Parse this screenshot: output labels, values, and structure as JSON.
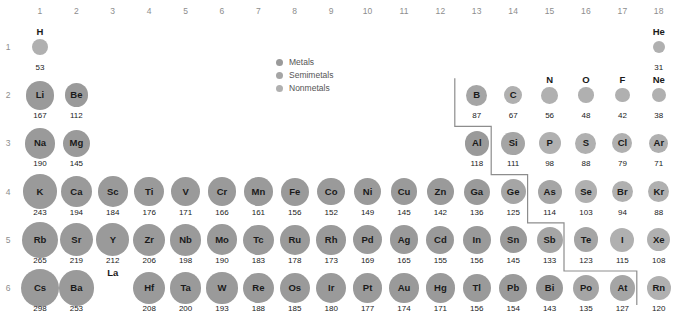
{
  "colors": {
    "metal": "#9a9a9a",
    "semimetal": "#a5a5a5",
    "nonmetal": "#b0b0b0",
    "text": "#1a1a1a",
    "muted": "#8d8d8d",
    "stair": "#8d8d8d"
  },
  "legend": {
    "items": [
      {
        "label": "Metals",
        "color": "#9a9a9a",
        "key": "metal"
      },
      {
        "label": "Semimetals",
        "color": "#a5a5a5",
        "key": "semimetal"
      },
      {
        "label": "Nonmetals",
        "color": "#b0b0b0",
        "key": "nonmetal"
      }
    ]
  },
  "axes": {
    "group_headers": [
      "1",
      "2",
      "3",
      "4",
      "5",
      "6",
      "7",
      "8",
      "9",
      "10",
      "11",
      "12",
      "13",
      "14",
      "15",
      "16",
      "17",
      "18"
    ],
    "period_labels": [
      "1",
      "2",
      "3",
      "4",
      "5",
      "6"
    ]
  },
  "chart_data": {
    "type": "scatter",
    "xlabel": "Group",
    "ylabel": "Period",
    "value_unit": "pm",
    "value_name": "Atomic radius",
    "encoding": "bubble area encodes atomic radius; grayscale fill encodes element class",
    "categories": [
      "1",
      "2",
      "3",
      "4",
      "5",
      "6",
      "7",
      "8",
      "9",
      "10",
      "11",
      "12",
      "13",
      "14",
      "15",
      "16",
      "17",
      "18"
    ],
    "legend_position": "top-center",
    "grid": false,
    "elements": [
      {
        "symbol": "H",
        "group": 1,
        "period": 1,
        "value": 53,
        "class": "nonmetal"
      },
      {
        "symbol": "He",
        "group": 18,
        "period": 1,
        "value": 31,
        "class": "nonmetal"
      },
      {
        "symbol": "Li",
        "group": 1,
        "period": 2,
        "value": 167,
        "class": "metal"
      },
      {
        "symbol": "Be",
        "group": 2,
        "period": 2,
        "value": 112,
        "class": "metal"
      },
      {
        "symbol": "B",
        "group": 13,
        "period": 2,
        "value": 87,
        "class": "semimetal"
      },
      {
        "symbol": "C",
        "group": 14,
        "period": 2,
        "value": 67,
        "class": "nonmetal"
      },
      {
        "symbol": "N",
        "group": 15,
        "period": 2,
        "value": 56,
        "class": "nonmetal"
      },
      {
        "symbol": "O",
        "group": 16,
        "period": 2,
        "value": 48,
        "class": "nonmetal"
      },
      {
        "symbol": "F",
        "group": 17,
        "period": 2,
        "value": 42,
        "class": "nonmetal"
      },
      {
        "symbol": "Ne",
        "group": 18,
        "period": 2,
        "value": 38,
        "class": "nonmetal"
      },
      {
        "symbol": "Na",
        "group": 1,
        "period": 3,
        "value": 190,
        "class": "metal"
      },
      {
        "symbol": "Mg",
        "group": 2,
        "period": 3,
        "value": 145,
        "class": "metal"
      },
      {
        "symbol": "Al",
        "group": 13,
        "period": 3,
        "value": 118,
        "class": "metal"
      },
      {
        "symbol": "Si",
        "group": 14,
        "period": 3,
        "value": 111,
        "class": "semimetal"
      },
      {
        "symbol": "P",
        "group": 15,
        "period": 3,
        "value": 98,
        "class": "nonmetal"
      },
      {
        "symbol": "S",
        "group": 16,
        "period": 3,
        "value": 88,
        "class": "nonmetal"
      },
      {
        "symbol": "Cl",
        "group": 17,
        "period": 3,
        "value": 79,
        "class": "nonmetal"
      },
      {
        "symbol": "Ar",
        "group": 18,
        "period": 3,
        "value": 71,
        "class": "nonmetal"
      },
      {
        "symbol": "K",
        "group": 1,
        "period": 4,
        "value": 243,
        "class": "metal"
      },
      {
        "symbol": "Ca",
        "group": 2,
        "period": 4,
        "value": 194,
        "class": "metal"
      },
      {
        "symbol": "Sc",
        "group": 3,
        "period": 4,
        "value": 184,
        "class": "metal"
      },
      {
        "symbol": "Ti",
        "group": 4,
        "period": 4,
        "value": 176,
        "class": "metal"
      },
      {
        "symbol": "V",
        "group": 5,
        "period": 4,
        "value": 171,
        "class": "metal"
      },
      {
        "symbol": "Cr",
        "group": 6,
        "period": 4,
        "value": 166,
        "class": "metal"
      },
      {
        "symbol": "Mn",
        "group": 7,
        "period": 4,
        "value": 161,
        "class": "metal"
      },
      {
        "symbol": "Fe",
        "group": 8,
        "period": 4,
        "value": 156,
        "class": "metal"
      },
      {
        "symbol": "Co",
        "group": 9,
        "period": 4,
        "value": 152,
        "class": "metal"
      },
      {
        "symbol": "Ni",
        "group": 10,
        "period": 4,
        "value": 149,
        "class": "metal"
      },
      {
        "symbol": "Cu",
        "group": 11,
        "period": 4,
        "value": 145,
        "class": "metal"
      },
      {
        "symbol": "Zn",
        "group": 12,
        "period": 4,
        "value": 142,
        "class": "metal"
      },
      {
        "symbol": "Ga",
        "group": 13,
        "period": 4,
        "value": 136,
        "class": "metal"
      },
      {
        "symbol": "Ge",
        "group": 14,
        "period": 4,
        "value": 125,
        "class": "semimetal"
      },
      {
        "symbol": "As",
        "group": 15,
        "period": 4,
        "value": 114,
        "class": "semimetal"
      },
      {
        "symbol": "Se",
        "group": 16,
        "period": 4,
        "value": 103,
        "class": "nonmetal"
      },
      {
        "symbol": "Br",
        "group": 17,
        "period": 4,
        "value": 94,
        "class": "nonmetal"
      },
      {
        "symbol": "Kr",
        "group": 18,
        "period": 4,
        "value": 88,
        "class": "nonmetal"
      },
      {
        "symbol": "Rb",
        "group": 1,
        "period": 5,
        "value": 265,
        "class": "metal"
      },
      {
        "symbol": "Sr",
        "group": 2,
        "period": 5,
        "value": 219,
        "class": "metal"
      },
      {
        "symbol": "Y",
        "group": 3,
        "period": 5,
        "value": 212,
        "class": "metal"
      },
      {
        "symbol": "Zr",
        "group": 4,
        "period": 5,
        "value": 206,
        "class": "metal"
      },
      {
        "symbol": "Nb",
        "group": 5,
        "period": 5,
        "value": 198,
        "class": "metal"
      },
      {
        "symbol": "Mo",
        "group": 6,
        "period": 5,
        "value": 190,
        "class": "metal"
      },
      {
        "symbol": "Tc",
        "group": 7,
        "period": 5,
        "value": 183,
        "class": "metal"
      },
      {
        "symbol": "Ru",
        "group": 8,
        "period": 5,
        "value": 178,
        "class": "metal"
      },
      {
        "symbol": "Rh",
        "group": 9,
        "period": 5,
        "value": 173,
        "class": "metal"
      },
      {
        "symbol": "Pd",
        "group": 10,
        "period": 5,
        "value": 169,
        "class": "metal"
      },
      {
        "symbol": "Ag",
        "group": 11,
        "period": 5,
        "value": 165,
        "class": "metal"
      },
      {
        "symbol": "Cd",
        "group": 12,
        "period": 5,
        "value": 155,
        "class": "metal"
      },
      {
        "symbol": "In",
        "group": 13,
        "period": 5,
        "value": 156,
        "class": "metal"
      },
      {
        "symbol": "Sn",
        "group": 14,
        "period": 5,
        "value": 145,
        "class": "metal"
      },
      {
        "symbol": "Sb",
        "group": 15,
        "period": 5,
        "value": 133,
        "class": "semimetal"
      },
      {
        "symbol": "Te",
        "group": 16,
        "period": 5,
        "value": 123,
        "class": "semimetal"
      },
      {
        "symbol": "I",
        "group": 17,
        "period": 5,
        "value": 115,
        "class": "nonmetal"
      },
      {
        "symbol": "Xe",
        "group": 18,
        "period": 5,
        "value": 108,
        "class": "nonmetal"
      },
      {
        "symbol": "Cs",
        "group": 1,
        "period": 6,
        "value": 298,
        "class": "metal"
      },
      {
        "symbol": "Ba",
        "group": 2,
        "period": 6,
        "value": 253,
        "class": "metal"
      },
      {
        "symbol": "La",
        "group": 3,
        "period": 6,
        "value": null,
        "class": "metal"
      },
      {
        "symbol": "Hf",
        "group": 4,
        "period": 6,
        "value": 208,
        "class": "metal"
      },
      {
        "symbol": "Ta",
        "group": 5,
        "period": 6,
        "value": 200,
        "class": "metal"
      },
      {
        "symbol": "W",
        "group": 6,
        "period": 6,
        "value": 193,
        "class": "metal"
      },
      {
        "symbol": "Re",
        "group": 7,
        "period": 6,
        "value": 188,
        "class": "metal"
      },
      {
        "symbol": "Os",
        "group": 8,
        "period": 6,
        "value": 185,
        "class": "metal"
      },
      {
        "symbol": "Ir",
        "group": 9,
        "period": 6,
        "value": 180,
        "class": "metal"
      },
      {
        "symbol": "Pt",
        "group": 10,
        "period": 6,
        "value": 177,
        "class": "metal"
      },
      {
        "symbol": "Au",
        "group": 11,
        "period": 6,
        "value": 174,
        "class": "metal"
      },
      {
        "symbol": "Hg",
        "group": 12,
        "period": 6,
        "value": 171,
        "class": "metal"
      },
      {
        "symbol": "Tl",
        "group": 13,
        "period": 6,
        "value": 156,
        "class": "metal"
      },
      {
        "symbol": "Pb",
        "group": 14,
        "period": 6,
        "value": 154,
        "class": "metal"
      },
      {
        "symbol": "Bi",
        "group": 15,
        "period": 6,
        "value": 143,
        "class": "metal"
      },
      {
        "symbol": "Po",
        "group": 16,
        "period": 6,
        "value": 135,
        "class": "semimetal"
      },
      {
        "symbol": "At",
        "group": 17,
        "period": 6,
        "value": 127,
        "class": "semimetal"
      },
      {
        "symbol": "Rn",
        "group": 18,
        "period": 6,
        "value": 120,
        "class": "nonmetal"
      }
    ]
  }
}
